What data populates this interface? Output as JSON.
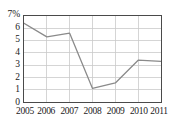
{
  "chart_data": {
    "type": "line",
    "title": "",
    "xlabel": "",
    "ylabel": "",
    "categories": [
      "2005",
      "2006",
      "2007",
      "2008",
      "2009",
      "2010",
      "2011"
    ],
    "values": [
      6.4,
      5.3,
      5.6,
      1.1,
      1.55,
      3.4,
      3.3
    ],
    "series": [
      {
        "name": "",
        "values": [
          6.4,
          5.3,
          5.6,
          1.1,
          1.55,
          3.4,
          3.3
        ]
      }
    ],
    "x_tick_labels": [
      "2005",
      "2006",
      "2007",
      "2008",
      "2009",
      "2010",
      "2011"
    ],
    "y_tick_labels": [
      "7%",
      "6",
      "5",
      "4",
      "3",
      "2",
      "1",
      "0"
    ],
    "y_tick_values": [
      7,
      6,
      5,
      4,
      3,
      2,
      1,
      0
    ],
    "ylim": [
      0,
      7
    ],
    "xlim": [
      2005,
      2011
    ],
    "unit": "%",
    "grid": true,
    "legend": "none",
    "colors": {
      "line": "#8a8a8a",
      "grid": "#c9c9c9",
      "axis": "#4a4a4a",
      "text": "#1a1a1a",
      "background": "#ffffff"
    }
  }
}
